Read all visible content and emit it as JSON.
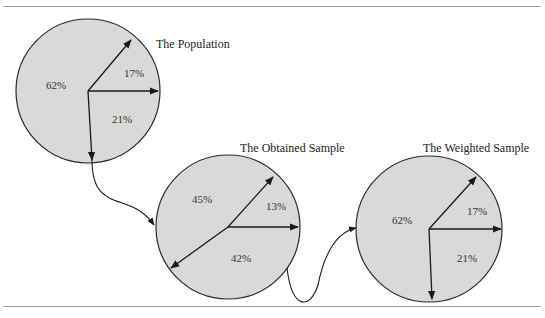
{
  "diagram": {
    "colors": {
      "fill": "#d9d9d9",
      "stroke": "#2a2a2a",
      "rule": "#9a9a9a"
    },
    "pies": [
      {
        "id": "population",
        "title": "The Population",
        "slices": [
          {
            "label": "62%",
            "value": 62
          },
          {
            "label": "17%",
            "value": 17
          },
          {
            "label": "21%",
            "value": 21
          }
        ]
      },
      {
        "id": "obtained",
        "title": "The Obtained Sample",
        "slices": [
          {
            "label": "45%",
            "value": 45
          },
          {
            "label": "13%",
            "value": 13
          },
          {
            "label": "42%",
            "value": 42
          }
        ]
      },
      {
        "id": "weighted",
        "title": "The Weighted  Sample",
        "slices": [
          {
            "label": "62%",
            "value": 62
          },
          {
            "label": "17%",
            "value": 17
          },
          {
            "label": "21%",
            "value": 21
          }
        ]
      }
    ],
    "flow": [
      "The Population",
      "The Obtained Sample",
      "The Weighted  Sample"
    ]
  }
}
